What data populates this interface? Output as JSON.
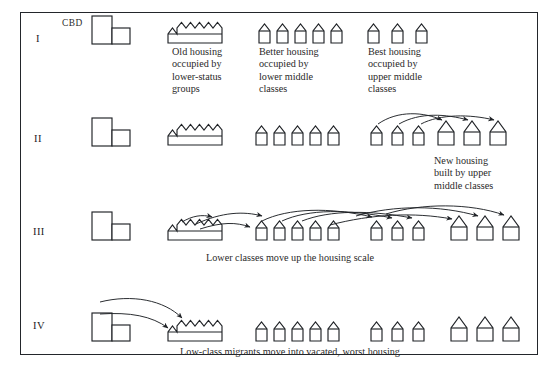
{
  "diagram": {
    "frame_color": "#23262b",
    "ink_color": "#1f2226",
    "paper_color": "#ffffff",
    "cbd_label": "CBD",
    "stages": [
      {
        "numeral": "I",
        "captions": [
          {
            "text": "Old housing\noccupied by\nlower-status\ngroups",
            "align": "left",
            "x": 172,
            "y": 47
          },
          {
            "text": "Better housing\noccupied by\nlower middle\nclasses",
            "align": "left",
            "x": 259,
            "y": 47
          },
          {
            "text": "Best housing\noccupied by\nupper middle\nclasses",
            "align": "left",
            "x": 368,
            "y": 47
          }
        ],
        "groups": [
          {
            "kind": "cbd",
            "count": 1
          },
          {
            "kind": "terrace",
            "count": 7
          },
          {
            "kind": "small-house",
            "count": 5
          },
          {
            "kind": "small-house",
            "count": 3
          }
        ]
      },
      {
        "numeral": "II",
        "captions": [
          {
            "text": "New housing\nbuilt by upper\nmiddle classes",
            "align": "left",
            "x": 434,
            "y": 155
          }
        ],
        "groups": [
          {
            "kind": "cbd",
            "count": 1
          },
          {
            "kind": "terrace",
            "count": 7
          },
          {
            "kind": "small-house",
            "count": 5
          },
          {
            "kind": "small-house",
            "count": 3
          },
          {
            "kind": "large-house",
            "count": 3
          }
        ],
        "arrows": 3
      },
      {
        "numeral": "III",
        "captions": [
          {
            "text": "Lower classes move up the housing scale",
            "align": "center",
            "x": 248,
            "y": 253
          }
        ],
        "groups": [
          {
            "kind": "cbd",
            "count": 1
          },
          {
            "kind": "terrace",
            "count": 7
          },
          {
            "kind": "small-house",
            "count": 5
          },
          {
            "kind": "small-house",
            "count": 3
          },
          {
            "kind": "large-house",
            "count": 3
          }
        ],
        "arrows": 7
      },
      {
        "numeral": "IV",
        "captions": [
          {
            "text": "Low-class migrants move into vacated, worst housing",
            "align": "center",
            "x": 195,
            "y": 347
          }
        ],
        "groups": [
          {
            "kind": "cbd",
            "count": 1
          },
          {
            "kind": "terrace",
            "count": 7
          },
          {
            "kind": "small-house",
            "count": 5
          },
          {
            "kind": "small-house",
            "count": 3
          },
          {
            "kind": "large-house",
            "count": 3
          }
        ],
        "arrows": 2
      }
    ]
  }
}
